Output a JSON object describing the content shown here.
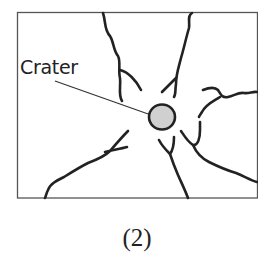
{
  "figure": {
    "label": "Crater",
    "caption": "(2)",
    "colors": {
      "stroke": "#222222",
      "crater_fill": "#d0d0d0",
      "frame": "#555555",
      "background": "#ffffff"
    },
    "frame": {
      "x": 17,
      "y": 12,
      "width": 240,
      "height": 186
    },
    "crater": {
      "cx": 162,
      "cy": 117,
      "rx": 13,
      "ry": 12
    }
  }
}
